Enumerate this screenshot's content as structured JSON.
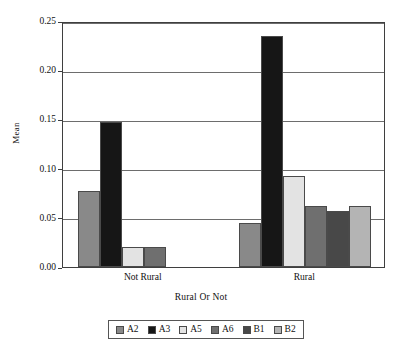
{
  "chart_data": {
    "type": "bar",
    "title": "",
    "subtitle": "",
    "xlabel": "Rural Or Not",
    "ylabel": "Mean",
    "categories": [
      "Not Rural",
      "Rural"
    ],
    "ylim": [
      0.0,
      0.25
    ],
    "yticks": [
      "0.00",
      "0.05",
      "0.10",
      "0.15",
      "0.20",
      "0.25"
    ],
    "ytick_values": [
      0.0,
      0.05,
      0.1,
      0.15,
      0.2,
      0.25
    ],
    "grid": "horizontal",
    "legend_position": "bottom",
    "series": [
      {
        "name": "A2",
        "color": "#898989",
        "values": [
          0.077,
          0.045
        ]
      },
      {
        "name": "A3",
        "color": "#161616",
        "values": [
          0.147,
          0.235
        ]
      },
      {
        "name": "A5",
        "color": "#e3e3e3",
        "values": [
          0.02,
          0.092
        ]
      },
      {
        "name": "A6",
        "color": "#6f6f6f",
        "values": [
          0.02,
          0.062
        ]
      },
      {
        "name": "B1",
        "color": "#484848",
        "values": [
          0.0,
          0.057
        ]
      },
      {
        "name": "B2",
        "color": "#b4b4b4",
        "values": [
          0.0,
          0.062
        ]
      }
    ]
  },
  "axes": {
    "ylabel": "Mean",
    "xlabel": "Rural Or Not",
    "ytick_labels": [
      "0.25",
      "0.20",
      "0.15",
      "0.10",
      "0.05",
      "0.00"
    ],
    "xtick_labels": [
      "Not Rural",
      "Rural"
    ]
  },
  "legend": {
    "items": [
      {
        "label": "A2",
        "color": "#898989"
      },
      {
        "label": "A3",
        "color": "#161616"
      },
      {
        "label": "A5",
        "color": "#e3e3e3"
      },
      {
        "label": "A6",
        "color": "#6f6f6f"
      },
      {
        "label": "B1",
        "color": "#484848"
      },
      {
        "label": "B2",
        "color": "#b4b4b4"
      }
    ]
  },
  "colors": {
    "axis": "#3f3f3f",
    "grid": "#6d6d6d",
    "background": "#ffffff",
    "text": "#111111"
  }
}
